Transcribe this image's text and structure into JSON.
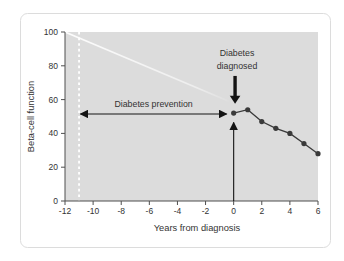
{
  "figure": {
    "background_color": "#ffffff",
    "panel_border_color": "#dcdcdc"
  },
  "chart_data": {
    "type": "line",
    "title": "",
    "xlabel": "Years from diagnosis",
    "ylabel": "Beta-cell function",
    "xlim": [
      -12,
      6
    ],
    "ylim": [
      0,
      100
    ],
    "x_ticks": [
      -12,
      -10,
      -8,
      -6,
      -4,
      -2,
      0,
      2,
      4,
      6
    ],
    "y_ticks": [
      0,
      20,
      40,
      60,
      80,
      100
    ],
    "grid": false,
    "legend": "none",
    "plot_background_color": "#dcdcdc",
    "series": [
      {
        "name": "beta-cell function observed from diagnosis",
        "color": "#3a3a3a",
        "x": [
          0,
          1,
          2,
          3,
          4,
          5,
          6
        ],
        "y": [
          52,
          54,
          47,
          43,
          40,
          34,
          28
        ]
      }
    ],
    "annotations": {
      "diagnosed_label": {
        "line1": "Diabetes",
        "line2": "diagnosed"
      },
      "prevention": {
        "label": "Diabetes prevention",
        "x_start": -10.9,
        "x_end": -0.5,
        "y": 51.5
      },
      "dashed_vline_x": -11,
      "extrapolation_line": {
        "x1": -12,
        "y1": 100,
        "x2": -0.35,
        "y2": 59
      },
      "up_arrow": {
        "x": 0,
        "y_from": 0,
        "y_to": 46.5
      },
      "down_arrow": {
        "x": 0.1,
        "y_from": 74,
        "y_to": 57.5
      }
    },
    "colors": {
      "axis": "#4f4f4f",
      "text": "#333333",
      "arrow": "#141414",
      "white_guides": "#ffffff"
    }
  }
}
